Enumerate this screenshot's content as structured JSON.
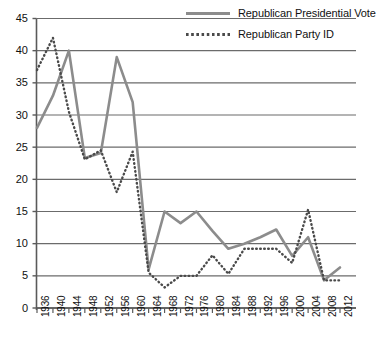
{
  "chart_data": {
    "type": "line",
    "title": "",
    "xlabel": "",
    "ylabel": "",
    "ylim": [
      0,
      45
    ],
    "ytick_step": 5,
    "yticks": [
      0,
      5,
      10,
      15,
      20,
      25,
      30,
      35,
      40,
      45
    ],
    "grid": true,
    "legend_position": "top-right",
    "categories": [
      "1936",
      "1940",
      "1944",
      "1948",
      "1952",
      "1956",
      "1960",
      "1964",
      "1968",
      "1972",
      "1976",
      "1980",
      "1984",
      "1988",
      "1992",
      "1996",
      "2000",
      "2004",
      "2008",
      "2012"
    ],
    "series": [
      {
        "name": "Republican Presidential Vote",
        "style": "solid",
        "color": "#8c8c8c",
        "values": [
          28.0,
          33.0,
          40.0,
          23.3,
          24.1,
          39.0,
          32.0,
          6.0,
          15.0,
          13.2,
          15.0,
          12.0,
          9.2,
          10.0,
          11.0,
          12.2,
          8.1,
          11.0,
          4.3,
          6.3
        ]
      },
      {
        "name": "Republican Party ID",
        "style": "dotted",
        "color": "#4a4a4a",
        "values": [
          37.0,
          42.0,
          30.5,
          23.1,
          24.5,
          18.0,
          24.3,
          5.5,
          3.2,
          5.0,
          5.0,
          8.2,
          5.3,
          9.2,
          9.2,
          9.2,
          7.0,
          15.3,
          4.3,
          4.3
        ]
      }
    ]
  },
  "legend": {
    "items": [
      {
        "label": "Republican Presidential Vote",
        "style": "solid"
      },
      {
        "label": "Republican Party ID",
        "style": "dotted"
      }
    ]
  },
  "axes": {
    "y_labels": [
      "45",
      "40",
      "35",
      "30",
      "25",
      "20",
      "15",
      "10",
      "5",
      "0"
    ],
    "x_labels": [
      "1936",
      "1940",
      "1944",
      "1948",
      "1952",
      "1956",
      "1960",
      "1964",
      "1968",
      "1972",
      "1976",
      "1980",
      "1984",
      "1988",
      "1992",
      "1996",
      "2000",
      "2004",
      "2008",
      "2012"
    ]
  },
  "colors": {
    "vote_line": "#8c8c8c",
    "partyid_line": "#4a4a4a",
    "gridline": "#6b6b6b",
    "axis": "#5a5a5a",
    "background": "#ffffff"
  }
}
